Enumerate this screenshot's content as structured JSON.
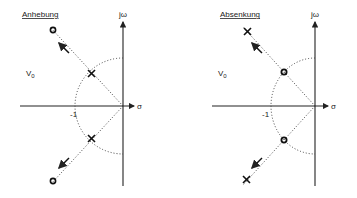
{
  "panels": [
    {
      "title": "Anhebung",
      "gain_label": "V",
      "gain_sub": "0",
      "imag_axis_label": "jω",
      "real_axis_label": "σ",
      "tick_label": "-1",
      "inner_marker": "pole",
      "outer_marker": "zero",
      "inner_positions": [
        [
          -0.7,
          0.7
        ],
        [
          -0.7,
          -0.7
        ]
      ],
      "outer_positions": [
        [
          -1.6,
          1.6
        ],
        [
          -1.6,
          -1.6
        ]
      ],
      "movement": "outward"
    },
    {
      "title": "Absenkung",
      "gain_label": "V",
      "gain_sub": "0",
      "imag_axis_label": "jω",
      "real_axis_label": "σ",
      "tick_label": "-1",
      "inner_marker": "zero",
      "outer_marker": "pole",
      "inner_positions": [
        [
          -0.7,
          0.7
        ],
        [
          -0.7,
          -0.7
        ]
      ],
      "outer_positions": [
        [
          -1.6,
          1.6
        ],
        [
          -1.6,
          -1.6
        ]
      ],
      "movement": "outward"
    }
  ]
}
